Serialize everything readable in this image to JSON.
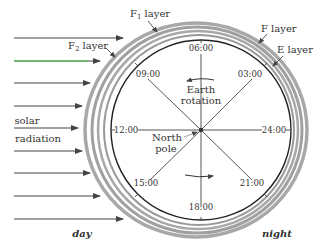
{
  "diagram": {
    "labels": {
      "f1_layer": "F",
      "f1_sub": "1",
      "f1_suffix": " layer",
      "f2_layer": "F",
      "f2_sub": "2",
      "f2_suffix": " layer",
      "f_layer": "F  layer",
      "e_layer": "E  layer",
      "solar": "solar",
      "radiation": "radiation",
      "earth": "Earth",
      "rotation": "rotation",
      "north": "North",
      "pole": "pole",
      "day": "day",
      "night": "night"
    },
    "clock_times": {
      "t0600": "06:00",
      "t0300": "03:00",
      "t2400": "24:00",
      "t2100": "21:00",
      "t1800": "18:00",
      "t1500": "15:00",
      "t1200": "12:00",
      "t0900": "09:00"
    },
    "colors": {
      "arrow": "#444444",
      "ring": "#9a9a9a",
      "earth_outline": "#222222",
      "text": "#333333",
      "highlight_arrow": "#44cc44"
    }
  }
}
